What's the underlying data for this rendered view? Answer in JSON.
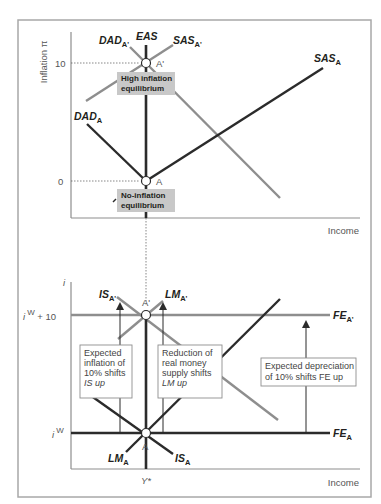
{
  "colors": {
    "dark_line": "#2b2b2b",
    "grey_line": "#8e8e8e",
    "frame": "#a8a8a8",
    "label_box_fill": "#c8c8c8",
    "note_box_border": "#8e8e8e"
  },
  "upper_panel": {
    "y_axis_label": "Inflation π",
    "x_axis_label": "Income",
    "y_ticks": [
      "10",
      "0"
    ],
    "curves": {
      "eas": {
        "name": "EAS",
        "sub": ""
      },
      "dad_a": {
        "name": "DAD",
        "sub": "A"
      },
      "dad_a_prime": {
        "name": "DAD",
        "sub": "A'"
      },
      "sas_a": {
        "name": "SAS",
        "sub": "A"
      },
      "sas_a_prime": {
        "name": "SAS",
        "sub": "A'"
      }
    },
    "points": {
      "a": "A",
      "a_prime": "A'"
    },
    "boxes": {
      "high": {
        "line1": "High inflation",
        "line2": "equilibrium"
      },
      "none": {
        "line1": "No-inflation",
        "line2": "equilibrium"
      }
    }
  },
  "lower_panel": {
    "y_axis_label": "i",
    "x_axis_label": "Income",
    "x_tick": "Y*",
    "y_ticks": {
      "iw_plus": {
        "base": "i",
        "sup": "W",
        "rest": " + 10"
      },
      "iw": {
        "base": "i",
        "sup": "W"
      }
    },
    "curves": {
      "is_a": {
        "name": "IS",
        "sub": "A"
      },
      "is_a_prime": {
        "name": "IS",
        "sub": "A'"
      },
      "lm_a": {
        "name": "LM",
        "sub": "A"
      },
      "lm_a_prime": {
        "name": "LM",
        "sub": "A'"
      },
      "fe_a": {
        "name": "FE",
        "sub": "A"
      },
      "fe_a_prime": {
        "name": "FE",
        "sub": "A'"
      }
    },
    "points": {
      "a": "A",
      "a_prime": "A'"
    },
    "notes": {
      "is_shift": [
        "Expected",
        "inflation of",
        "10% shifts",
        "IS up"
      ],
      "lm_shift": [
        "Reduction of",
        "real money",
        "supply shifts",
        "LM up"
      ],
      "fe_shift": [
        "Expected depreciation",
        "of 10% shifts FE up"
      ]
    }
  }
}
